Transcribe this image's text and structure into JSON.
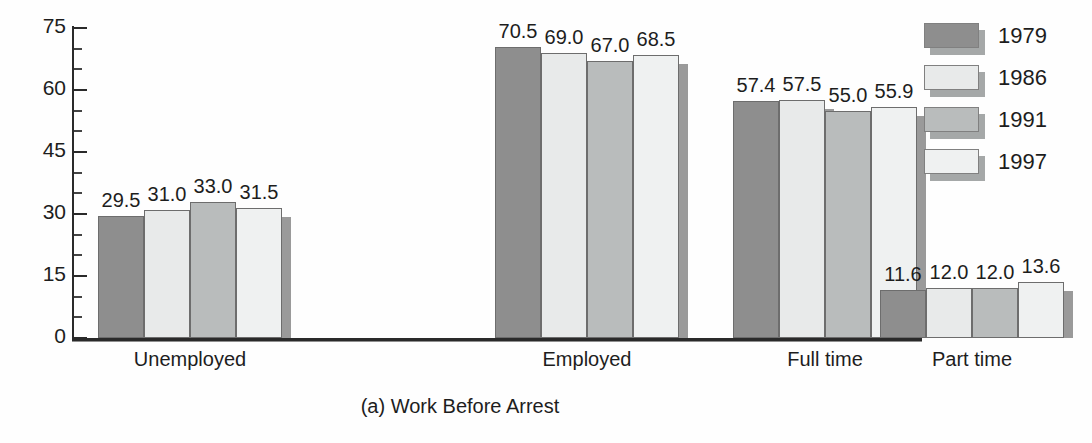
{
  "chart_data": {
    "type": "bar",
    "title": "",
    "caption": "(a) Work Before Arrest",
    "xlabel": "",
    "ylabel": "",
    "ylim": [
      0,
      75
    ],
    "ytick_labels": [
      "0",
      "15",
      "30",
      "45",
      "60",
      "75"
    ],
    "ytick_values": [
      0,
      15,
      30,
      45,
      60,
      75
    ],
    "minor_tick_interval": 5,
    "grid": false,
    "legend_position": "right",
    "categories": [
      "Unemployed",
      "Employed",
      "Full time",
      "Part time"
    ],
    "series": [
      {
        "name": "1979",
        "color": "#8e8e8e",
        "values": [
          29.5,
          70.5,
          57.4,
          11.6
        ],
        "labels": [
          "29.5",
          "70.5",
          "57.4",
          "11.6"
        ]
      },
      {
        "name": "1986",
        "color": "#e8eaea",
        "values": [
          31.0,
          69.0,
          57.5,
          12.0
        ],
        "labels": [
          "31.0",
          "69.0",
          "57.5",
          "12.0"
        ]
      },
      {
        "name": "1991",
        "color": "#b9bcbc",
        "values": [
          33.0,
          67.0,
          55.0,
          12.0
        ],
        "labels": [
          "33.0",
          "67.0",
          "55.0",
          "12.0"
        ]
      },
      {
        "name": "1997",
        "color": "#eff1f1",
        "values": [
          31.5,
          68.5,
          55.9,
          13.6
        ],
        "labels": [
          "31.5",
          "68.5",
          "55.9",
          "13.6"
        ]
      }
    ]
  },
  "legend": {
    "items": [
      {
        "label": "1979",
        "swatch_class": "swatch-1979"
      },
      {
        "label": "1986",
        "swatch_class": "swatch-1986"
      },
      {
        "label": "1991",
        "swatch_class": "swatch-1991"
      },
      {
        "label": "1997",
        "swatch_class": "swatch-1997"
      }
    ]
  },
  "axis": {
    "y_labels": [
      "75",
      "60",
      "45",
      "30",
      "15",
      "0"
    ]
  }
}
